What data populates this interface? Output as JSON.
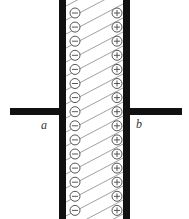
{
  "diagram": {
    "labels": {
      "left_terminal": "a",
      "right_terminal": "b"
    },
    "symbols": {
      "negative": "−",
      "positive": "+"
    },
    "rows": 15,
    "colors": {
      "plate": "#111111",
      "hatch": "#777777",
      "symbol": "#444444",
      "background": "#ffffff"
    }
  }
}
